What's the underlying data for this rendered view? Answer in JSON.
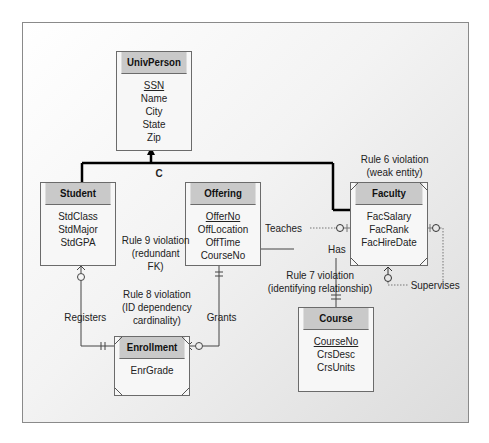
{
  "diagram": {
    "generalization": {
      "label": "C",
      "parent": "UnivPerson",
      "children": [
        "Student",
        "Faculty"
      ]
    },
    "entities": {
      "univperson": {
        "name": "UnivPerson",
        "attributes": [
          "SSN",
          "Name",
          "City",
          "State",
          "Zip"
        ],
        "primary_key": "SSN",
        "weak": false
      },
      "student": {
        "name": "Student",
        "attributes": [
          "StdClass",
          "StdMajor",
          "StdGPA"
        ],
        "weak": false
      },
      "offering": {
        "name": "Offering",
        "attributes": [
          "OfferNo",
          "OffLocation",
          "OffTime",
          "CourseNo"
        ],
        "primary_key": "OfferNo",
        "weak": false
      },
      "faculty": {
        "name": "Faculty",
        "attributes": [
          "FacSalary",
          "FacRank",
          "FacHireDate"
        ],
        "weak": true
      },
      "enrollment": {
        "name": "Enrollment",
        "attributes": [
          "EnrGrade"
        ],
        "weak": true
      },
      "course": {
        "name": "Course",
        "attributes": [
          "CourseNo",
          "CrsDesc",
          "CrsUnits"
        ],
        "primary_key": "CourseNo",
        "weak": false
      }
    },
    "relationships": {
      "teaches": "Teaches",
      "has": "Has",
      "registers": "Registers",
      "grants": "Grants",
      "supervises": "Supervises"
    },
    "annotations": {
      "rule6": [
        "Rule 6 violation",
        "(weak entity)"
      ],
      "rule7": [
        "Rule 7 violation",
        "(identifying relationship)"
      ],
      "rule8": [
        "Rule 8 violation",
        "(ID dependency",
        "cardinality)"
      ],
      "rule9": [
        "Rule 9 violation",
        "(redundant",
        "FK)"
      ]
    }
  }
}
